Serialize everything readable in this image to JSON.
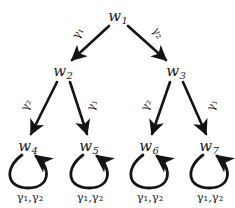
{
  "diagram": {
    "type": "directed-tree-graph",
    "background_color": "#ffffff",
    "stroke_color": "#141414",
    "nodes": [
      {
        "id": "w1",
        "label": "w",
        "subscript": "1",
        "x": 118,
        "y": 16
      },
      {
        "id": "w2",
        "label": "w",
        "subscript": "2",
        "x": 63,
        "y": 71
      },
      {
        "id": "w3",
        "label": "w",
        "subscript": "3",
        "x": 176,
        "y": 71
      },
      {
        "id": "w4",
        "label": "w",
        "subscript": "4",
        "x": 28,
        "y": 146
      },
      {
        "id": "w5",
        "label": "w",
        "subscript": "5",
        "x": 89,
        "y": 146
      },
      {
        "id": "w6",
        "label": "w",
        "subscript": "6",
        "x": 149,
        "y": 146
      },
      {
        "id": "w7",
        "label": "w",
        "subscript": "7",
        "x": 209,
        "y": 146
      }
    ],
    "edges": [
      {
        "id": "e-w1-w2",
        "from": "w1",
        "to": "w2",
        "label": "γ₁",
        "label_x": 78,
        "label_y": 33,
        "label_rotation": -58
      },
      {
        "id": "e-w1-w3",
        "from": "w1",
        "to": "w3",
        "label": "γ₂",
        "label_x": 158,
        "label_y": 33,
        "label_rotation": 58
      },
      {
        "id": "e-w2-w4",
        "from": "w2",
        "to": "w4",
        "label": "γ₂",
        "label_x": 26,
        "label_y": 105,
        "label_rotation": -68
      },
      {
        "id": "e-w2-w5",
        "from": "w2",
        "to": "w5",
        "label": "γ₁",
        "label_x": 92,
        "label_y": 105,
        "label_rotation": -68
      },
      {
        "id": "e-w3-w6",
        "from": "w3",
        "to": "w6",
        "label": "γ₂",
        "label_x": 146,
        "label_y": 105,
        "label_rotation": -68
      },
      {
        "id": "e-w3-w7",
        "from": "w3",
        "to": "w7",
        "label": "γ₁",
        "label_x": 212,
        "label_y": 105,
        "label_rotation": -68
      }
    ],
    "self_loops": [
      {
        "id": "loop-w4",
        "node": "w4",
        "label": "γ₁,γ₂",
        "cx": 28,
        "cy": 170,
        "label_x": 30,
        "label_y": 197
      },
      {
        "id": "loop-w5",
        "node": "w5",
        "label": "γ₁,γ₂",
        "cx": 89,
        "cy": 170,
        "label_x": 90,
        "label_y": 197
      },
      {
        "id": "loop-w6",
        "node": "w6",
        "label": "γ₁,γ₂",
        "cx": 149,
        "cy": 170,
        "label_x": 150,
        "label_y": 197
      },
      {
        "id": "loop-w7",
        "node": "w7",
        "label": "γ₁,γ₂",
        "cx": 209,
        "cy": 170,
        "label_x": 210,
        "label_y": 197
      }
    ]
  }
}
